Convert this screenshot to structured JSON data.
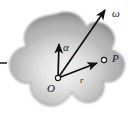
{
  "figure": {
    "background_color": "#ffffff",
    "body": {
      "name": "rigid-body-blob",
      "fill_edge_color": "#8e8e8e",
      "fill_center_color": "#efefef",
      "outline_color": "#7a7a7a"
    },
    "points": [
      {
        "id": "O",
        "label": "O",
        "x": 58,
        "y": 78,
        "marker": "open-circle"
      },
      {
        "id": "P",
        "label": "P",
        "x": 104,
        "y": 60,
        "marker": "open-circle"
      }
    ],
    "vectors": [
      {
        "id": "alpha",
        "label": "α",
        "from": "O",
        "tip_x": 59,
        "tip_y": 41,
        "color": "#111111"
      },
      {
        "id": "omega",
        "label": "ω",
        "from": "O",
        "tip_x": 108,
        "tip_y": 7,
        "color": "#111111"
      },
      {
        "id": "r",
        "label": "r",
        "from": "O",
        "tip_x": 99,
        "tip_y": 62,
        "color": "#111111"
      }
    ],
    "tick_mark": {
      "name": "left-edge-tick",
      "x1": 0,
      "y1": 63,
      "x2": 7,
      "y2": 63,
      "color": "#222222"
    }
  }
}
